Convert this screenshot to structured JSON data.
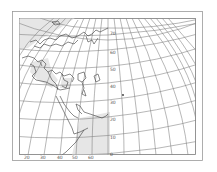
{
  "figure": {
    "type": "map",
    "projection": "oblique azimuthal grid (meridians converging toward top center)",
    "colors": {
      "background": "#ffffff",
      "frame": "#8c8c8c",
      "grid": "#7a7a7a",
      "coast": "#3a3a3a",
      "land_shade": "#e6e6e6"
    }
  },
  "latitude_labels": [
    {
      "text": "70",
      "x": 110,
      "y": 34
    },
    {
      "text": "60",
      "x": 110,
      "y": 53
    },
    {
      "text": "50",
      "x": 110,
      "y": 70
    },
    {
      "text": "40",
      "x": 110,
      "y": 87
    },
    {
      "text": "30",
      "x": 110,
      "y": 103
    },
    {
      "text": "20",
      "x": 110,
      "y": 120
    },
    {
      "text": "10",
      "x": 110,
      "y": 138
    },
    {
      "text": "0",
      "x": 110,
      "y": 155
    }
  ],
  "longitude_labels": [
    {
      "text": "20",
      "x": 27,
      "y": 156
    },
    {
      "text": "30",
      "x": 43,
      "y": 156
    },
    {
      "text": "40",
      "x": 60,
      "y": 156
    },
    {
      "text": "50",
      "x": 75,
      "y": 156
    },
    {
      "text": "60",
      "x": 91,
      "y": 156
    }
  ],
  "markers": [
    {
      "name": "point-marker",
      "x": 123,
      "y": 95
    }
  ]
}
